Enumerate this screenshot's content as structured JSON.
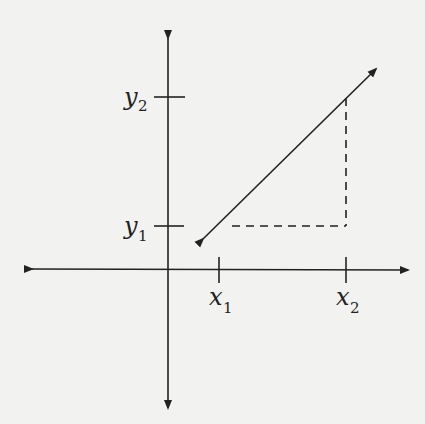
{
  "diagram": {
    "type": "coordinate-plane-vector",
    "labels": {
      "x1": {
        "base": "x",
        "sub": "1"
      },
      "x2": {
        "base": "x",
        "sub": "2"
      },
      "y1": {
        "base": "y",
        "sub": "1"
      },
      "y2": {
        "base": "y",
        "sub": "2"
      }
    },
    "colors": {
      "line": "#222222",
      "background": "#f2f2f0"
    }
  }
}
